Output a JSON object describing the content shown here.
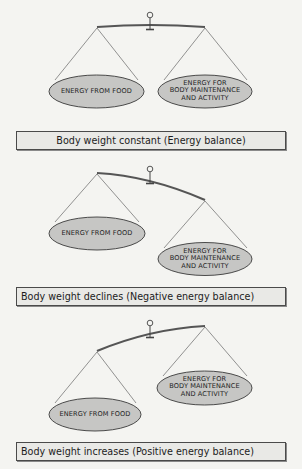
{
  "diagram": {
    "colors": {
      "background": "#f4f4f1",
      "pan_fill": "#c6c6c4",
      "pan_stroke": "#3a3a3a",
      "beam": "#555555",
      "string": "#555555",
      "caption_fill": "#e9e9e6",
      "caption_border": "#4a4a4a"
    },
    "panels": [
      {
        "id": "balance",
        "state": "level",
        "left_pan_label": "ENERGY FROM FOOD",
        "right_pan_label_lines": [
          "ENERGY FOR",
          "BODY MAINTENANCE",
          "AND ACTIVITY"
        ],
        "caption": "Body weight constant  (Energy balance)"
      },
      {
        "id": "negative",
        "state": "right-heavier",
        "left_pan_label": "ENERGY FROM FOOD",
        "right_pan_label_lines": [
          "ENERGY FOR",
          "BODY MAINTENANCE",
          "AND ACTIVITY"
        ],
        "caption": "Body weight declines (Negative energy balance)"
      },
      {
        "id": "positive",
        "state": "left-heavier",
        "left_pan_label": "ENERGY FROM FOOD",
        "right_pan_label_lines": [
          "ENERGY FOR",
          "BODY MAINTENANCE",
          "AND ACTIVITY"
        ],
        "caption": "Body weight increases (Positive energy balance)"
      }
    ]
  }
}
